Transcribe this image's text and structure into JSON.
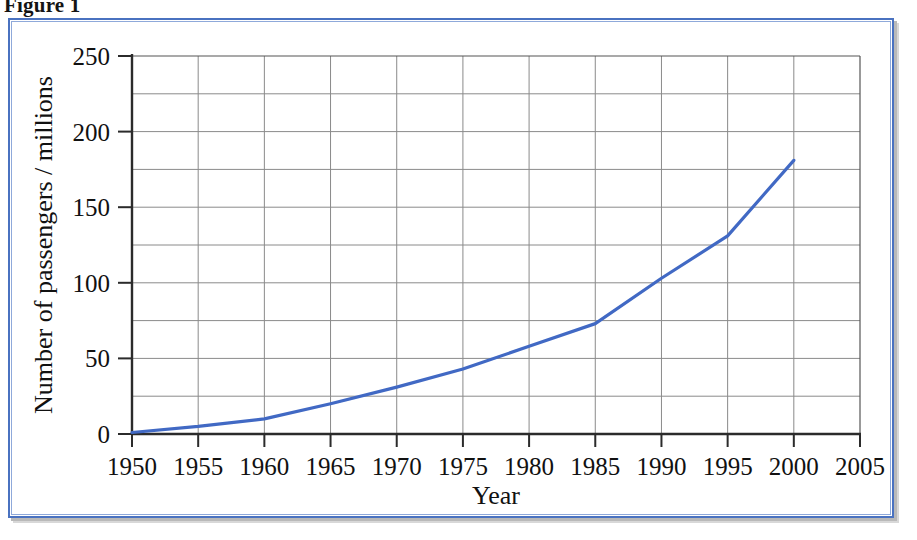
{
  "figure": {
    "caption": "Figure 1",
    "frame_color": "#4a72c0"
  },
  "chart_data": {
    "type": "line",
    "title": "",
    "xlabel": "Year",
    "ylabel": "Number of passengers / millions",
    "xlim": [
      1950,
      2005
    ],
    "ylim": [
      0,
      250
    ],
    "xticks": [
      1950,
      1955,
      1960,
      1965,
      1970,
      1975,
      1980,
      1985,
      1990,
      1995,
      2000,
      2005
    ],
    "yticks": [
      0,
      50,
      100,
      150,
      200,
      250
    ],
    "x_minor_step": 5,
    "y_minor_step": 25,
    "grid": true,
    "legend": "none",
    "line_color": "#4169c4",
    "series": [
      {
        "name": "Number of passengers",
        "x": [
          1950,
          1955,
          1960,
          1965,
          1970,
          1975,
          1980,
          1985,
          1990,
          1995,
          2000
        ],
        "values": [
          1,
          5,
          10,
          20,
          31,
          43,
          58,
          73,
          103,
          131,
          181
        ]
      }
    ]
  },
  "axis_labels": {
    "x_tick_texts": [
      "1950",
      "1955",
      "1960",
      "1965",
      "1970",
      "1975",
      "1980",
      "1985",
      "1990",
      "1995",
      "2000",
      "2005"
    ],
    "y_tick_texts": [
      "0",
      "50",
      "100",
      "150",
      "200",
      "250"
    ],
    "x_axis_title": "Year",
    "y_axis_title": "Number of passengers / millions"
  }
}
